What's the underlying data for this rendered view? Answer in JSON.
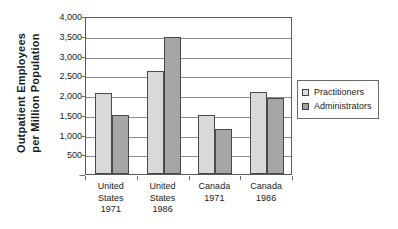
{
  "chart_data": {
    "type": "bar",
    "title": "",
    "xlabel": "",
    "ylabel": "Outpatient Employees per Million Population",
    "ylabel_line1": "Outpatient  Employees",
    "ylabel_line2": "per Million Population",
    "categories": [
      "United States 1971",
      "United States 1986",
      "Canada 1971",
      "Canada 1986"
    ],
    "category_lines": [
      [
        "United",
        "States",
        "1971"
      ],
      [
        "United",
        "States",
        "1986"
      ],
      [
        "Canada",
        "1971"
      ],
      [
        "Canada",
        "1986"
      ]
    ],
    "series": [
      {
        "name": "Practitioners",
        "values": [
          2050,
          2600,
          1490,
          2080
        ],
        "color": "#d9d9d9"
      },
      {
        "name": "Administrators",
        "values": [
          1490,
          3480,
          1150,
          1930
        ],
        "color": "#a6a6a6"
      }
    ],
    "ylim": [
      0,
      4000
    ],
    "ytick_values": [
      4000,
      3500,
      3000,
      2500,
      2000,
      1500,
      1000,
      500,
      0
    ],
    "ytick_labels": [
      "4,000",
      "3,500",
      "3,000",
      "2,500",
      "2,000",
      "1,500",
      "1,000",
      "500",
      "-"
    ],
    "grid": true,
    "legend_position": "right"
  },
  "legend": {
    "entries": [
      {
        "label": "Practitioners"
      },
      {
        "label": "Administrators"
      }
    ]
  },
  "colors": {
    "series_practitioners": "#d9d9d9",
    "series_administrators": "#a6a6a6",
    "axis": "#5a5a5a",
    "grid": "#8d8d8d",
    "text": "#1a1a1a",
    "background": "#ffffff"
  }
}
